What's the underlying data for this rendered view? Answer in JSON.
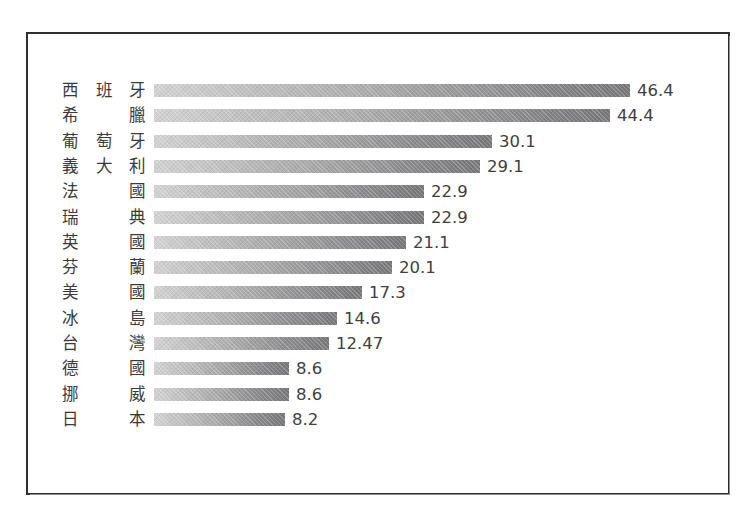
{
  "chart_data": {
    "type": "bar",
    "title": "",
    "subtitle": "",
    "xlabel": "",
    "ylabel": "",
    "orientation": "horizontal",
    "grid": false,
    "legend": null,
    "axis_visible": false,
    "xlim": [
      0,
      46.4
    ],
    "categories": [
      "西班牙",
      "希臘",
      "葡萄牙",
      "義大利",
      "法國",
      "瑞典",
      "英國",
      "芬蘭",
      "美國",
      "冰島",
      "台灣",
      "德國",
      "挪威",
      "日本"
    ],
    "values": [
      46.4,
      44.4,
      30.1,
      29.1,
      22.9,
      22.9,
      21.1,
      20.1,
      17.3,
      14.6,
      12.47,
      8.6,
      8.6,
      8.2
    ],
    "value_labels": [
      "46.4",
      "44.4",
      "30.1",
      "29.1",
      "22.9",
      "22.9",
      "21.1",
      "20.1",
      "17.3",
      "14.6",
      "12.47",
      "8.6",
      "8.6",
      "8.2"
    ],
    "bar_pixel_widths": [
      476,
      456,
      338,
      326,
      270,
      270,
      252,
      238,
      208,
      183,
      175,
      135,
      135,
      131
    ],
    "colors": {
      "bar_gradient_start": "#d2d2d2",
      "bar_gradient_end": "#77777a",
      "label_text": "#3a3a3c",
      "value_text": "#3f3f41",
      "frame_border": "#2e2e30",
      "background": "#ffffff"
    }
  },
  "rows": [
    {
      "label": "西班牙",
      "value": "46.4"
    },
    {
      "label": "希臘",
      "value": "44.4"
    },
    {
      "label": "葡萄牙",
      "value": "30.1"
    },
    {
      "label": "義大利",
      "value": "29.1"
    },
    {
      "label": "法國",
      "value": "22.9"
    },
    {
      "label": "瑞典",
      "value": "22.9"
    },
    {
      "label": "英國",
      "value": "21.1"
    },
    {
      "label": "芬蘭",
      "value": "20.1"
    },
    {
      "label": "美國",
      "value": "17.3"
    },
    {
      "label": "冰島",
      "value": "14.6"
    },
    {
      "label": "台灣",
      "value": "12.47"
    },
    {
      "label": "德國",
      "value": "8.6"
    },
    {
      "label": "挪威",
      "value": "8.6"
    },
    {
      "label": "日本",
      "value": "8.2"
    }
  ]
}
